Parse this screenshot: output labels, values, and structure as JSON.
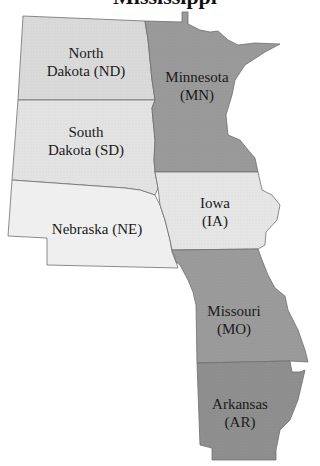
{
  "title": "Mississippi",
  "colors": {
    "light": "#ececec",
    "medium": "#dadada",
    "dark": "#9a9a9a",
    "darker": "#8f8f8f",
    "border": "#6e6e6e",
    "text": "#1a1a1a"
  },
  "states": [
    {
      "name": "North Dakota",
      "abbr": "ND",
      "line1": "North",
      "line2": "Dakota (ND)",
      "shade": "medium"
    },
    {
      "name": "South Dakota",
      "abbr": "SD",
      "line1": "South",
      "line2": "Dakota (SD)",
      "shade": "light"
    },
    {
      "name": "Nebraska",
      "abbr": "NE",
      "line1": "Nebraska (NE)",
      "shade": "light"
    },
    {
      "name": "Minnesota",
      "abbr": "MN",
      "line1": "Minnesota",
      "line2": "(MN)",
      "shade": "dark"
    },
    {
      "name": "Iowa",
      "abbr": "IA",
      "line1": "Iowa",
      "line2": "(IA)",
      "shade": "light"
    },
    {
      "name": "Missouri",
      "abbr": "MO",
      "line1": "Missouri",
      "line2": "(MO)",
      "shade": "dark"
    },
    {
      "name": "Arkansas",
      "abbr": "AR",
      "line1": "Arkansas",
      "line2": "(AR)",
      "shade": "darker"
    }
  ]
}
